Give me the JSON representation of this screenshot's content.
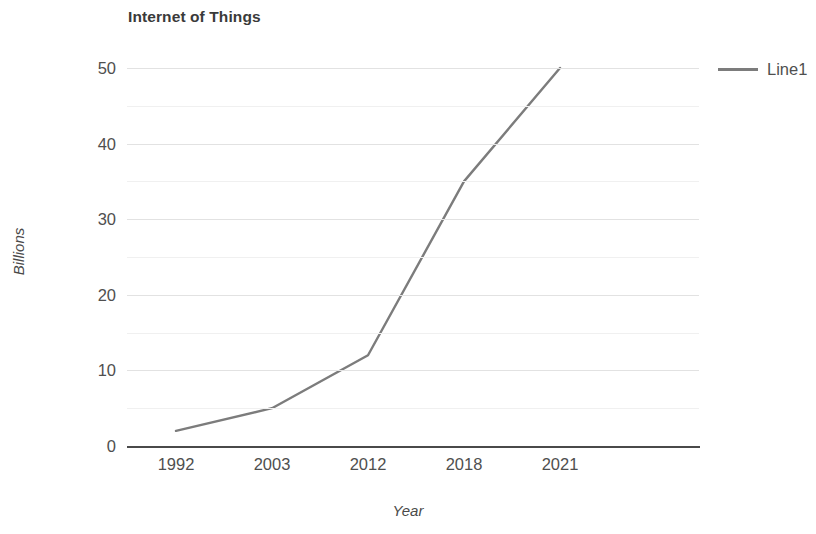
{
  "chart_data": {
    "type": "line",
    "title": "Internet of Things",
    "xlabel": "Year",
    "ylabel": "Billions",
    "categories": [
      "1992",
      "2003",
      "2012",
      "2018",
      "2021"
    ],
    "series": [
      {
        "name": "Line1",
        "color": "#7c7c7c",
        "values": [
          2,
          5,
          12,
          35,
          50
        ]
      }
    ],
    "ylim": [
      0,
      50
    ],
    "y_ticks": [
      0,
      10,
      20,
      30,
      40,
      50
    ],
    "y_minor_ticks": [
      5,
      15,
      25,
      35,
      45
    ],
    "grid": true,
    "legend_position": "right",
    "axis_color": "#4a4a4a",
    "gridline_color": "#e2e2e2"
  },
  "legend": {
    "entries": [
      {
        "label": "Line1"
      }
    ]
  },
  "icons": {
    "legend_line": "line-swatch-icon"
  }
}
